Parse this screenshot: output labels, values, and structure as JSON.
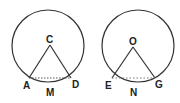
{
  "figures": [
    {
      "name": "left-circle",
      "center_label": "C",
      "left_label": "A",
      "arc_label": "M",
      "right_label": "D"
    },
    {
      "name": "right-circle",
      "center_label": "O",
      "left_label": "E",
      "arc_label": "N",
      "right_label": "G"
    }
  ],
  "colors": {
    "stroke": "#333333",
    "background": "#ffffff"
  }
}
